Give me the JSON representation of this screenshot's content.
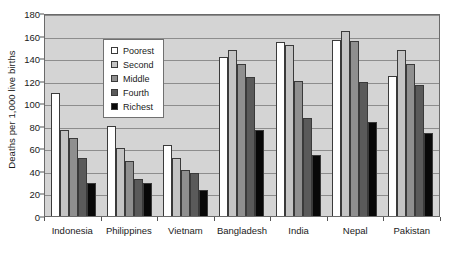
{
  "chart_data": {
    "type": "bar",
    "title": "",
    "subtitle": "",
    "xlabel": "",
    "ylabel": "Deaths per 1,000 live births",
    "ylim": [
      0,
      180
    ],
    "ytick_step": 20,
    "yticks": [
      0,
      20,
      40,
      60,
      80,
      100,
      120,
      140,
      160,
      180
    ],
    "ytick_labels": [
      "0",
      "20",
      "40",
      "60",
      "80",
      "100",
      "120",
      "140",
      "160",
      "180"
    ],
    "grid": true,
    "grid_axis": "y",
    "legend_position": "inside-upper-left",
    "plot_background": "#d4d4d4",
    "categories": [
      "Indonesia",
      "Philippines",
      "Vietnam",
      "Bangladesh",
      "India",
      "Nepal",
      "Pakistan"
    ],
    "series": [
      {
        "name": "Poorest",
        "color": "#ffffff",
        "values": [
          109,
          80,
          63,
          141,
          154,
          156,
          124
        ]
      },
      {
        "name": "Second",
        "color": "#c4c4c4",
        "values": [
          76,
          60,
          51,
          147,
          152,
          164,
          147
        ]
      },
      {
        "name": "Middle",
        "color": "#8f8f8f",
        "values": [
          69,
          49,
          41,
          135,
          120,
          155,
          135
        ]
      },
      {
        "name": "Fourth",
        "color": "#5a5a5a",
        "values": [
          51,
          33,
          38,
          123,
          87,
          119,
          116
        ]
      },
      {
        "name": "Richest",
        "color": "#080808",
        "values": [
          29,
          29,
          23,
          76,
          54,
          83,
          74
        ]
      }
    ]
  }
}
